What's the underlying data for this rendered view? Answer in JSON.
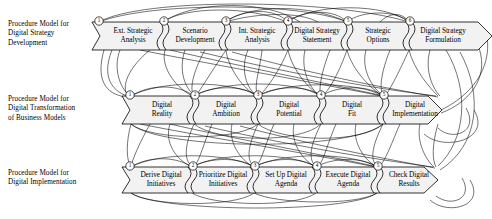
{
  "figure": {
    "background_color": "#ffffff",
    "line_color": "#000000",
    "band_fill": "#f2f2f2"
  },
  "rows": [
    {
      "id": "row-strategy",
      "label": "Procedure Model for\nDigital Strategy\nDevelopment",
      "band": {
        "x": 92,
        "y": 22,
        "width": 400,
        "height": 28
      },
      "stages": [
        {
          "num": "1",
          "label": "Ext. Strategic\nAnalysis"
        },
        {
          "num": "2",
          "label": "Scenario\nDevelopment"
        },
        {
          "num": "3",
          "label": "Int. Strategic\nAnalysis"
        },
        {
          "num": "4",
          "label": "Digital Strategy\nStatement"
        },
        {
          "num": "5",
          "label": "Strategic\nOptions"
        },
        {
          "num": "6",
          "label": "Digital Strategy\nFormulation"
        }
      ]
    },
    {
      "id": "row-transformation",
      "label": "Procedure Model for\nDigital Transformation\nof Business Models",
      "band": {
        "x": 122,
        "y": 96,
        "width": 320,
        "height": 28
      },
      "stages": [
        {
          "num": "1",
          "label": "Digital\nReality"
        },
        {
          "num": "2",
          "label": "Digital\nAmbition"
        },
        {
          "num": "3",
          "label": "Digital\nPotential"
        },
        {
          "num": "4",
          "label": "Digital\nFit"
        },
        {
          "num": "5",
          "label": "Digital\nImplementation"
        }
      ]
    },
    {
      "id": "row-implementation",
      "label": "Procedure Model for\nDigital Implementation",
      "band": {
        "x": 122,
        "y": 167,
        "width": 316,
        "height": 26
      },
      "stages": [
        {
          "num": "1",
          "label": "Derive Digital\nInitiatives"
        },
        {
          "num": "2",
          "label": "Prioritize Digital\nInitiatives"
        },
        {
          "num": "3",
          "label": "Set Up Digital\nAgenda"
        },
        {
          "num": "4",
          "label": "Execute Digital\nAgenda"
        },
        {
          "num": "5",
          "label": "Check Digital\nResults"
        }
      ]
    }
  ]
}
